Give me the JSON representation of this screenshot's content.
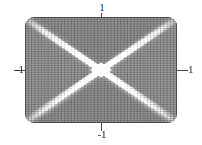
{
  "figure": {
    "name": "surface-mesh-plot",
    "background": "#ffffff",
    "mesh_color": "#5a5a5a",
    "fill_light": "#ffffff",
    "fill_dark": "#8a8a8a",
    "axis_color": "#4a4a4a"
  },
  "axes": {
    "x_label_left": "-1",
    "x_label_right": "1",
    "y_label_top": "1",
    "y_label_bottom": "-1"
  },
  "chart_data": {
    "type": "heatmap",
    "title": "",
    "xlabel": "",
    "ylabel": "",
    "xlim": [
      -1,
      1
    ],
    "ylim": [
      -1,
      1
    ],
    "grid": false,
    "legend": false,
    "x_ticks": [
      -1,
      1
    ],
    "y_ticks": [
      -1,
      1
    ],
    "x_tick_labels": [
      "-1",
      "1"
    ],
    "y_tick_labels": [
      "-1",
      "1"
    ],
    "mesh_rows": 46,
    "mesh_cols": 46,
    "value_range": [
      0,
      1
    ],
    "features": [
      {
        "name": "diagonal-ridge-major",
        "from": [
          -1,
          1
        ],
        "to": [
          1,
          -1
        ],
        "value": 1.0
      },
      {
        "name": "diagonal-ridge-minor",
        "from": [
          -1,
          -1
        ],
        "to": [
          1,
          1
        ],
        "value": 1.0
      },
      {
        "name": "center-diamond",
        "at": [
          0,
          0
        ],
        "value": 1.0
      },
      {
        "name": "region-top",
        "value": 0.35
      },
      {
        "name": "region-bottom",
        "value": 0.35
      },
      {
        "name": "region-left",
        "value": 0.4
      },
      {
        "name": "region-right",
        "value": 0.4
      }
    ]
  }
}
